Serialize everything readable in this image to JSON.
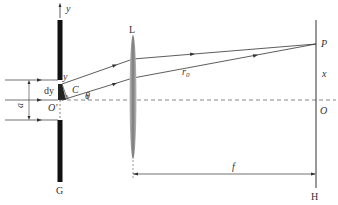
{
  "diagram": {
    "labels": {
      "y_axis": "y",
      "y_point": "y",
      "dy": "dy",
      "slit_width": "a",
      "origin_slit": "O",
      "origin_prime": "′",
      "point_C": "C",
      "angle": "θ",
      "lens": "L",
      "r0": "r",
      "r0_sub": "0",
      "screen_point": "P",
      "x_dist": "x",
      "screen_origin": "O",
      "focal_length": "f",
      "slit_screen": "G",
      "observation_screen": "H"
    },
    "colors": {
      "line": "#333333",
      "slit": "#111111",
      "lens": "#8a8a8a"
    }
  }
}
